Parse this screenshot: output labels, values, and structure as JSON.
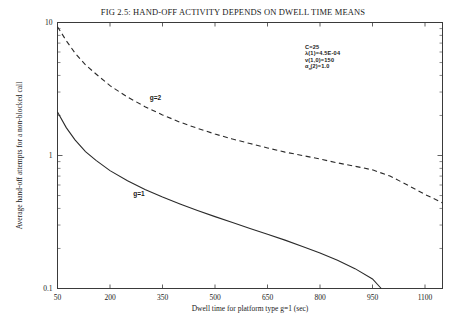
{
  "figure": {
    "title": "FIG 2.5:  HAND-OFF ACTIVITY DEPENDS ON DWELL TIME MEANS"
  },
  "annotation": {
    "lines": [
      "C=25",
      "λ(1)=4.5E-04",
      "v(1,0)=150",
      "α (2)=1.0"
    ],
    "subscript": "n"
  },
  "chart_data": {
    "type": "line",
    "title": "FIG 2.5:  HAND-OFF ACTIVITY DEPENDS ON DWELL TIME MEANS",
    "xlabel": "Dwell time for platform type g=1  (sec)",
    "ylabel": "Average hand-off attempts for a non-blocked call",
    "xlim": [
      50,
      1150
    ],
    "ylim": [
      0.1,
      10
    ],
    "yscale": "log",
    "xscale": "linear",
    "grid": false,
    "legend": "inline-curve-labels",
    "xticks": [
      50,
      200,
      350,
      500,
      650,
      800,
      950,
      1100
    ],
    "xticklabels": [
      "50",
      "200",
      "350",
      "500",
      "650",
      "800",
      "950",
      "1100"
    ],
    "yticks": [
      0.1,
      1,
      10
    ],
    "yticklabels": [
      "0.1",
      "1",
      "10"
    ],
    "series": [
      {
        "name": "g=2",
        "style": "dashed",
        "label_x": 330,
        "label_y": 2.6,
        "x": [
          50,
          75,
          100,
          130,
          160,
          200,
          250,
          300,
          350,
          400,
          450,
          500,
          550,
          600,
          650,
          700,
          750,
          800,
          850,
          900,
          950,
          1000,
          1050,
          1100,
          1150
        ],
        "y": [
          9.3,
          7.3,
          5.9,
          4.8,
          4.1,
          3.35,
          2.75,
          2.33,
          2.02,
          1.78,
          1.6,
          1.45,
          1.33,
          1.23,
          1.14,
          1.06,
          1.0,
          0.94,
          0.88,
          0.83,
          0.78,
          0.7,
          0.6,
          0.51,
          0.44
        ]
      },
      {
        "name": "g=1",
        "style": "solid",
        "label_x": 283,
        "label_y": 0.5,
        "x": [
          50,
          75,
          100,
          130,
          160,
          200,
          250,
          300,
          350,
          400,
          450,
          500,
          550,
          600,
          650,
          700,
          750,
          800,
          850,
          900,
          950,
          975
        ],
        "y": [
          2.12,
          1.62,
          1.31,
          1.07,
          0.92,
          0.77,
          0.645,
          0.556,
          0.487,
          0.432,
          0.386,
          0.347,
          0.313,
          0.283,
          0.256,
          0.231,
          0.207,
          0.185,
          0.163,
          0.141,
          0.118,
          0.1
        ]
      }
    ]
  }
}
